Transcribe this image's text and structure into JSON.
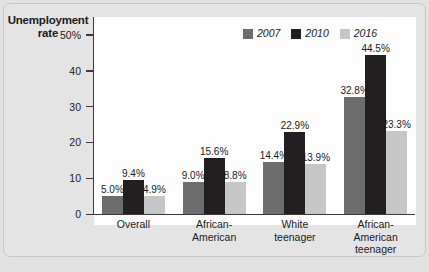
{
  "figure": {
    "y_axis_title": "Unemployment rate"
  },
  "chart_data": {
    "type": "bar",
    "title": "",
    "subtitle": "",
    "xlabel": "",
    "ylabel": "Unemployment rate",
    "ylim": [
      0,
      55
    ],
    "grid": false,
    "legend_position": "top-right",
    "categories": [
      "Overall",
      "African-American",
      "White teenager",
      "African-American teenager"
    ],
    "category_lines": [
      [
        "Overall"
      ],
      [
        "African-",
        "American"
      ],
      [
        "White",
        "teenager"
      ],
      [
        "African-",
        "American",
        "teenager"
      ]
    ],
    "ytick_labels": [
      "0",
      "10",
      "20",
      "30",
      "40",
      "50%"
    ],
    "ytick_values": [
      0,
      10,
      20,
      30,
      40,
      50
    ],
    "series": [
      {
        "name": "2007",
        "color": "#6d6d6d",
        "values": [
          5.0,
          9.0,
          14.4,
          32.8
        ],
        "labels": [
          "5.0%",
          "9.0%",
          "14.4%",
          "32.8%"
        ]
      },
      {
        "name": "2010",
        "color": "#231f20",
        "values": [
          9.4,
          15.6,
          22.9,
          44.5
        ],
        "labels": [
          "9.4%",
          "15.6%",
          "22.9%",
          "44.5%"
        ]
      },
      {
        "name": "2016",
        "color": "#c6c6c6",
        "values": [
          4.9,
          8.8,
          13.9,
          23.3
        ],
        "labels": [
          "4.9%",
          "8.8%",
          "13.9%",
          "23.3%"
        ]
      }
    ]
  }
}
